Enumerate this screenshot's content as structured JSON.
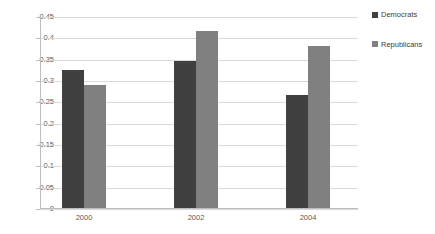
{
  "chart_data": {
    "type": "bar",
    "title": "",
    "subtitle": "",
    "xlabel": "",
    "ylabel": "",
    "categories": [
      "2000",
      "2002",
      "2004"
    ],
    "series": [
      {
        "name": "Democrats",
        "color": "#404040",
        "values": [
          0.323,
          0.345,
          0.265
        ]
      },
      {
        "name": "Republicans",
        "color": "#808080",
        "values": [
          0.288,
          0.415,
          0.38
        ]
      }
    ],
    "ylim": [
      0,
      0.45
    ],
    "yticks": [
      "0",
      "0.05",
      "0.1",
      "0.15",
      "0.2",
      "0.25",
      "0.3",
      "0.35",
      "0.4",
      "0.45"
    ],
    "ytick_values": [
      0,
      0.05,
      0.1,
      0.15,
      0.2,
      0.25,
      0.3,
      0.35,
      0.4,
      0.45
    ],
    "grid": true,
    "grid_axis": "y",
    "legend_position": "right",
    "gridline_color": "#d9d9d9",
    "axis_color": "#bfbfbf",
    "text_color": "#5a5a5a",
    "background": "#ffffff"
  }
}
